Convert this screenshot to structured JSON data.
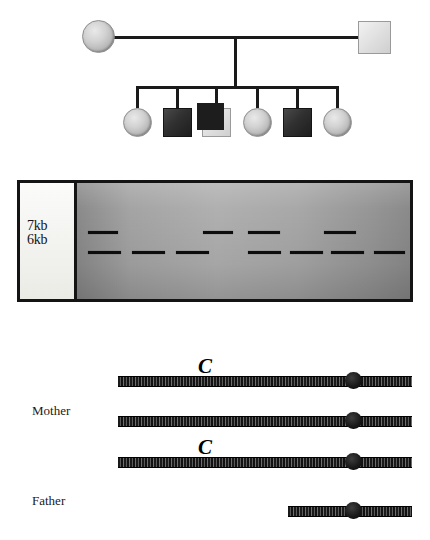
{
  "figure": {
    "background_color": "#ffffff",
    "ink_color": "#1a1a1a"
  },
  "pedigree": {
    "name": "pedigree-chart",
    "generation1": [
      {
        "id": "mother",
        "sex": "female",
        "shape": "circle",
        "fill": "light-grey",
        "label": ""
      },
      {
        "id": "father",
        "sex": "male",
        "shape": "square",
        "fill": "light-with-shadow",
        "label": ""
      }
    ],
    "generation2": [
      {
        "id": "child-1",
        "sex": "female",
        "shape": "circle",
        "fill": "light-grey",
        "affected": false
      },
      {
        "id": "child-2",
        "sex": "male",
        "shape": "square",
        "fill": "dark",
        "affected": true
      },
      {
        "id": "child-3",
        "sex": "male",
        "shape": "square",
        "fill": "light",
        "affected": false
      },
      {
        "id": "child-4",
        "sex": "female",
        "shape": "circle",
        "fill": "light-grey",
        "affected": false
      },
      {
        "id": "child-5",
        "sex": "male",
        "shape": "square",
        "fill": "dark",
        "affected": true
      },
      {
        "id": "child-6",
        "sex": "female",
        "shape": "circle",
        "fill": "light-grey",
        "affected": false
      }
    ],
    "connectors": {
      "marriage_line": true,
      "sibship_line": true,
      "descent_line": true
    }
  },
  "gel": {
    "name": "gel-electrophoresis",
    "border_color": "#141414",
    "gel_color": "#a4a4a4",
    "label_panel_color": "#f5f5f1",
    "size_markers": [
      {
        "label": "7kb",
        "row": "upper"
      },
      {
        "label": "6kb",
        "row": "lower"
      }
    ],
    "lane_count": 8,
    "lanes": [
      {
        "lane": 1,
        "bands": [
          "7kb",
          "6kb"
        ]
      },
      {
        "lane": 2,
        "bands": [
          "6kb"
        ]
      },
      {
        "lane": 3,
        "bands": [
          "6kb"
        ]
      },
      {
        "lane": 4,
        "bands": [
          "7kb"
        ]
      },
      {
        "lane": 5,
        "bands": [
          "7kb",
          "6kb"
        ]
      },
      {
        "lane": 6,
        "bands": [
          "6kb"
        ]
      },
      {
        "lane": 7,
        "bands": [
          "7kb",
          "6kb"
        ]
      },
      {
        "lane": 8,
        "bands": [
          "6kb"
        ]
      }
    ]
  },
  "chromosomes": {
    "name": "chromosome-haplotypes",
    "labels": {
      "mother": "Mother",
      "father": "Father"
    },
    "allele_symbol": "C",
    "rows": [
      {
        "index": 1,
        "owner": "Mother",
        "length": "full",
        "allele": "C",
        "has_allele": true,
        "centromere": true
      },
      {
        "index": 2,
        "owner": "Mother",
        "length": "full",
        "allele": "",
        "has_allele": false,
        "centromere": true
      },
      {
        "index": 3,
        "owner": "Father",
        "length": "full",
        "allele": "C",
        "has_allele": true,
        "centromere": true
      },
      {
        "index": 4,
        "owner": "Father",
        "length": "short",
        "allele": "",
        "has_allele": false,
        "centromere": true
      }
    ]
  }
}
